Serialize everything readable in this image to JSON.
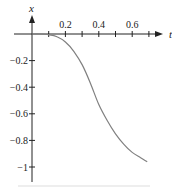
{
  "chart_data": {
    "type": "line",
    "title": "",
    "xlabel": "t",
    "ylabel": "x",
    "xlim": [
      0,
      0.75
    ],
    "ylim": [
      -1.1,
      0.1
    ],
    "grid": false,
    "legend": null,
    "x_ticks": [
      0.1,
      0.2,
      0.3,
      0.4,
      0.5,
      0.6,
      0.7
    ],
    "x_tick_labels": [
      {
        "value": 0.2,
        "label": "0.2"
      },
      {
        "value": 0.4,
        "label": "0.4"
      },
      {
        "value": 0.6,
        "label": "0.6"
      }
    ],
    "y_ticks": [
      -0.2,
      -0.4,
      -0.6,
      -0.8,
      -1.0
    ],
    "y_tick_labels": [
      {
        "value": -0.2,
        "label": "−0.2"
      },
      {
        "value": -0.4,
        "label": "−0.4"
      },
      {
        "value": -0.6,
        "label": "−0.6"
      },
      {
        "value": -0.8,
        "label": "−0.8"
      },
      {
        "value": -1.0,
        "label": "−1"
      }
    ],
    "series": [
      {
        "name": "x(t)",
        "color": "#808080",
        "x": [
          0.0,
          0.05,
          0.1,
          0.15,
          0.2,
          0.25,
          0.3,
          0.35,
          0.4,
          0.45,
          0.5,
          0.55,
          0.6,
          0.65,
          0.69
        ],
        "values": [
          0.0,
          0.0,
          -0.005,
          -0.02,
          -0.06,
          -0.13,
          -0.23,
          -0.37,
          -0.53,
          -0.65,
          -0.75,
          -0.83,
          -0.89,
          -0.93,
          -0.96
        ]
      }
    ]
  },
  "labels": {
    "x_axis_name": "t",
    "y_axis_name": "x"
  }
}
